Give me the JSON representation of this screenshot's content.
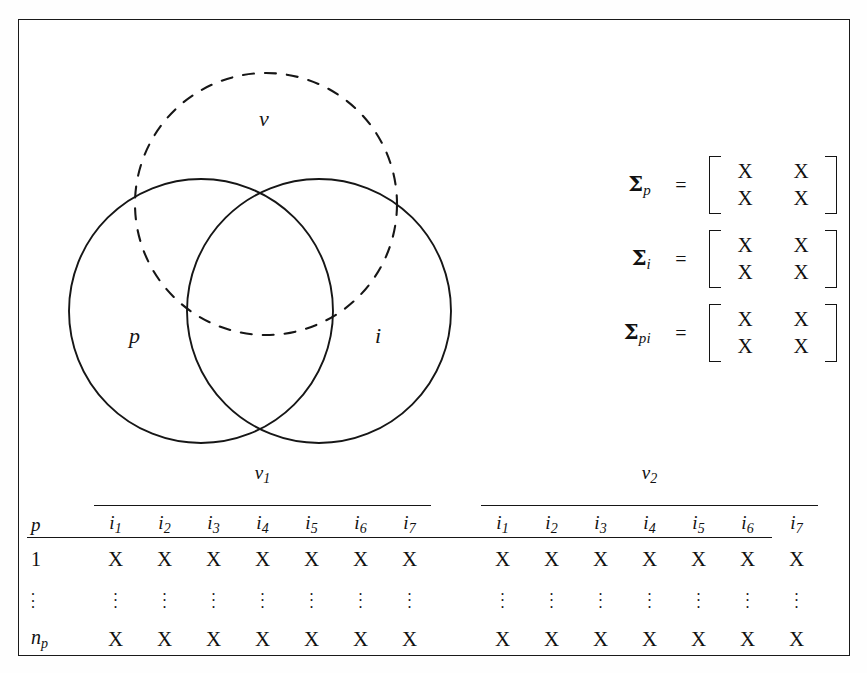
{
  "figure": {
    "type": "venn-and-table-schematic",
    "venn": {
      "labels": {
        "v": "v",
        "p": "p",
        "i": "i"
      },
      "circles": [
        {
          "name": "v",
          "style": "dashed",
          "cx": 247,
          "cy": 184,
          "r": 131
        },
        {
          "name": "p",
          "style": "solid",
          "cx": 182,
          "cy": 291,
          "r": 132
        },
        {
          "name": "i",
          "style": "solid",
          "cx": 300,
          "cy": 291,
          "r": 132
        }
      ]
    },
    "matrices": [
      {
        "name_base": "Σ",
        "name_sub": "p",
        "equals": "=",
        "rows": [
          [
            "X",
            "X"
          ],
          [
            "X",
            "X"
          ]
        ]
      },
      {
        "name_base": "Σ",
        "name_sub": "i",
        "equals": "=",
        "rows": [
          [
            "X",
            "X"
          ],
          [
            "X",
            "X"
          ]
        ]
      },
      {
        "name_base": "Σ",
        "name_sub": "pi",
        "equals": "=",
        "rows": [
          [
            "X",
            "X"
          ],
          [
            "X",
            "X"
          ]
        ]
      }
    ],
    "table": {
      "row_header_label": "p",
      "groups": [
        {
          "name_base": "v",
          "name_sub": "1",
          "columns": [
            {
              "base": "i",
              "sub": "1"
            },
            {
              "base": "i",
              "sub": "2"
            },
            {
              "base": "i",
              "sub": "3"
            },
            {
              "base": "i",
              "sub": "4"
            },
            {
              "base": "i",
              "sub": "5"
            },
            {
              "base": "i",
              "sub": "6"
            },
            {
              "base": "i",
              "sub": "7"
            }
          ]
        },
        {
          "name_base": "v",
          "name_sub": "2",
          "columns": [
            {
              "base": "i",
              "sub": "1"
            },
            {
              "base": "i",
              "sub": "2"
            },
            {
              "base": "i",
              "sub": "3"
            },
            {
              "base": "i",
              "sub": "4"
            },
            {
              "base": "i",
              "sub": "5"
            },
            {
              "base": "i",
              "sub": "6"
            },
            {
              "base": "i",
              "sub": "7"
            }
          ]
        }
      ],
      "rows": [
        {
          "label_base": "1",
          "label_sub": "",
          "kind": "values",
          "group1": [
            "X",
            "X",
            "X",
            "X",
            "X",
            "X",
            "X"
          ],
          "group2": [
            "X",
            "X",
            "X",
            "X",
            "X",
            "X",
            "X"
          ]
        },
        {
          "label_base": "⋮",
          "label_sub": "",
          "kind": "ellipsis",
          "group1": [
            "⋮",
            "⋮",
            "⋮",
            "⋮",
            "⋮",
            "⋮",
            "⋮"
          ],
          "group2": [
            "⋮",
            "⋮",
            "⋮",
            "⋮",
            "⋮",
            "⋮",
            "⋮"
          ]
        },
        {
          "label_base": "n",
          "label_sub": "p",
          "kind": "values",
          "group1": [
            "X",
            "X",
            "X",
            "X",
            "X",
            "X",
            "X"
          ],
          "group2": [
            "X",
            "X",
            "X",
            "X",
            "X",
            "X",
            "X"
          ]
        }
      ]
    },
    "colors": {
      "ink": "#161616",
      "page": "#ffffff"
    }
  }
}
